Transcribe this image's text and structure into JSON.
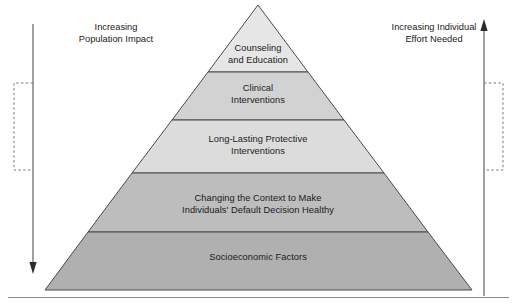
{
  "diagram": {
    "type": "health-impact-pyramid",
    "background": "#ffffff",
    "axis_labels": {
      "left": "Increasing\nPopulation Impact",
      "right": "Increasing Individual\nEffort Needed"
    },
    "arrows": {
      "left": {
        "direction": "down",
        "color": "#555555"
      },
      "right": {
        "direction": "up",
        "color": "#2b2b2b"
      }
    },
    "brackets": {
      "left": {
        "style": "dashed",
        "color": "#777777"
      },
      "right": {
        "style": "dashed",
        "color": "#777777"
      }
    },
    "tiers": [
      {
        "label": "Counseling\nand Education",
        "fill": "#e6e6e6",
        "level": 1
      },
      {
        "label": "Clinical\nInterventions",
        "fill": "#d2d2d2",
        "level": 2
      },
      {
        "label": "Long-Lasting Protective\nInterventions",
        "fill": "#dcdcdc",
        "level": 3
      },
      {
        "label": "Changing the Context to Make\nIndividuals' Default Decision Healthy",
        "fill": "#bdbdbd",
        "level": 4
      },
      {
        "label": "Socioeconomic Factors",
        "fill": "#b0b0b0",
        "level": 5
      }
    ],
    "stroke": "#4a4a4a",
    "footer_rule": "#8a8a8a"
  }
}
